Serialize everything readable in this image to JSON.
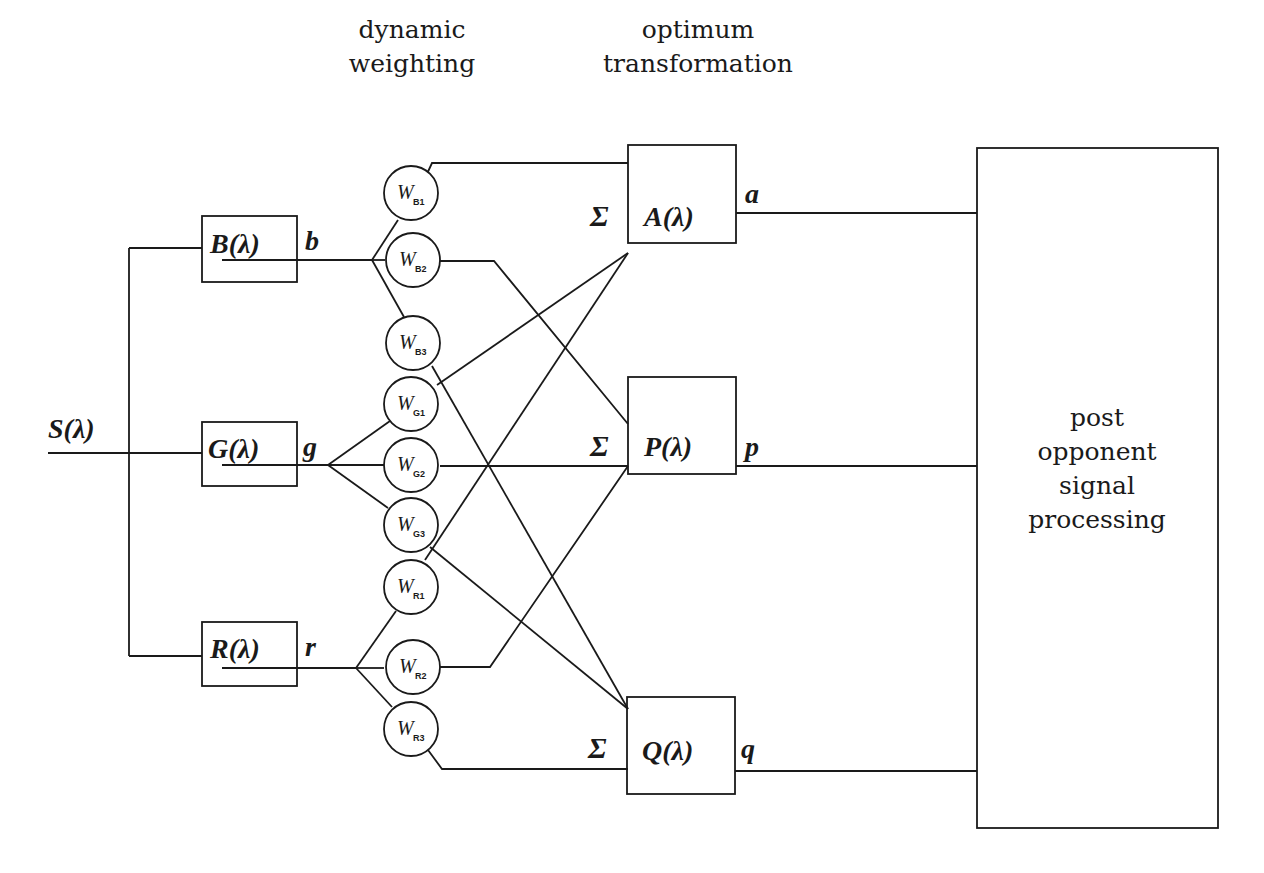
{
  "headings": {
    "dynamic_weighting": [
      "dynamic",
      "weighting"
    ],
    "optimum_transformation": [
      "optimum",
      "transformation"
    ]
  },
  "input": {
    "label": "S(λ)"
  },
  "receptors": [
    {
      "id": "B",
      "box_label": "B(λ)",
      "output": "b"
    },
    {
      "id": "G",
      "box_label": "G(λ)",
      "output": "g"
    },
    {
      "id": "R",
      "box_label": "R(λ)",
      "output": "r"
    }
  ],
  "weights": [
    {
      "main": "W",
      "sub": "B1"
    },
    {
      "main": "W",
      "sub": "B2"
    },
    {
      "main": "W",
      "sub": "B3"
    },
    {
      "main": "W",
      "sub": "G1"
    },
    {
      "main": "W",
      "sub": "G2"
    },
    {
      "main": "W",
      "sub": "G3"
    },
    {
      "main": "W",
      "sub": "R1"
    },
    {
      "main": "W",
      "sub": "R2"
    },
    {
      "main": "W",
      "sub": "R3"
    }
  ],
  "transforms": [
    {
      "id": "A",
      "box_label": "A(λ)",
      "output": "a",
      "sum_symbol": "Σ",
      "inputs": [
        "WB1",
        "WG1",
        "WR2"
      ]
    },
    {
      "id": "P",
      "box_label": "P(λ)",
      "output": "p",
      "sum_symbol": "Σ",
      "inputs": [
        "WB2",
        "WG2",
        "WR1"
      ]
    },
    {
      "id": "Q",
      "box_label": "Q(λ)",
      "output": "q",
      "sum_symbol": "Σ",
      "inputs": [
        "WB3",
        "WG3",
        "WR3"
      ]
    }
  ],
  "post_processing": {
    "lines": [
      "post",
      "opponent",
      "signal",
      "processing"
    ]
  }
}
